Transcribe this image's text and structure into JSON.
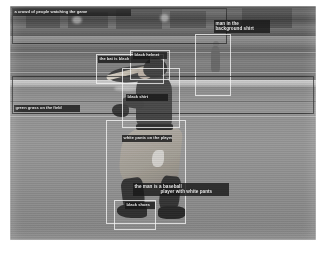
{
  "figure": {
    "kind": "dense-captioning-visualization",
    "scene": "baseball batter swinging at home plate on a field",
    "frame": {
      "x": 10,
      "y": 6,
      "width": 306,
      "height": 234
    }
  },
  "palette": {
    "box_stroke_light": "#fafafa",
    "box_stroke_dark": "#191919",
    "label_plate": "#101010",
    "label_text": "#f2f2f2",
    "field_dirt": "#9a9a9a",
    "field_grass": "#7a7a7a",
    "chalk_line": "#d8d8d8"
  },
  "detections": [
    {
      "id": "det-1",
      "label": "a crowd of people watching the game",
      "box": {
        "x": 2,
        "y": 2,
        "width": 215,
        "height": 36
      },
      "label_box": {
        "x": 3,
        "y": 3,
        "width": 118,
        "height": 7
      },
      "stroke": "dark"
    },
    {
      "id": "det-2",
      "label": "man in the background",
      "box": {
        "x": 185,
        "y": 28,
        "width": 36,
        "height": 62
      },
      "label_box": {
        "x": 204,
        "y": 14,
        "width": 56,
        "height": 13
      },
      "label_line_1": "man in the",
      "label_line_2": "background shirt",
      "stroke": "light"
    },
    {
      "id": "det-3",
      "label": "green grass on the field",
      "box": {
        "x": 2,
        "y": 70,
        "width": 302,
        "height": 38
      },
      "label_box": {
        "x": 4,
        "y": 99,
        "width": 66,
        "height": 8
      },
      "stroke": "dark"
    },
    {
      "id": "det-4",
      "label": "the bat is black",
      "box": {
        "x": 86,
        "y": 48,
        "width": 68,
        "height": 30
      },
      "label_box": {
        "x": 88,
        "y": 50,
        "width": 52,
        "height": 7
      },
      "stroke": "light"
    },
    {
      "id": "det-5",
      "label": "black helmet",
      "box": {
        "x": 120,
        "y": 44,
        "width": 40,
        "height": 30
      },
      "label_box": {
        "x": 123,
        "y": 46,
        "width": 34,
        "height": 7
      },
      "stroke": "light"
    },
    {
      "id": "det-6",
      "label": "black shirt",
      "box": {
        "x": 112,
        "y": 62,
        "width": 58,
        "height": 60
      },
      "label_box": {
        "x": 116,
        "y": 88,
        "width": 42,
        "height": 7
      },
      "stroke": "light"
    },
    {
      "id": "det-7",
      "label": "white pants on the player",
      "box": {
        "x": 96,
        "y": 114,
        "width": 80,
        "height": 104
      },
      "label_box": {
        "x": 112,
        "y": 129,
        "width": 50,
        "height": 8
      },
      "stroke": "light"
    },
    {
      "id": "det-8",
      "label": "the man is a baseball player with white pants",
      "box": {
        "x": 122,
        "y": 176,
        "width": 98,
        "height": 14
      },
      "label_box": {
        "x": 123,
        "y": 177,
        "width": 96,
        "height": 13
      },
      "label_line_1": "the man is a baseball",
      "label_line_2": "player with white pants",
      "stroke": "light"
    },
    {
      "id": "det-9",
      "label": "black shoes",
      "box": {
        "x": 104,
        "y": 194,
        "width": 42,
        "height": 30
      },
      "label_box": {
        "x": 115,
        "y": 196,
        "width": 30,
        "height": 13
      },
      "stroke": "light"
    }
  ],
  "counts": {
    "boxes": 9,
    "labels": 9
  }
}
